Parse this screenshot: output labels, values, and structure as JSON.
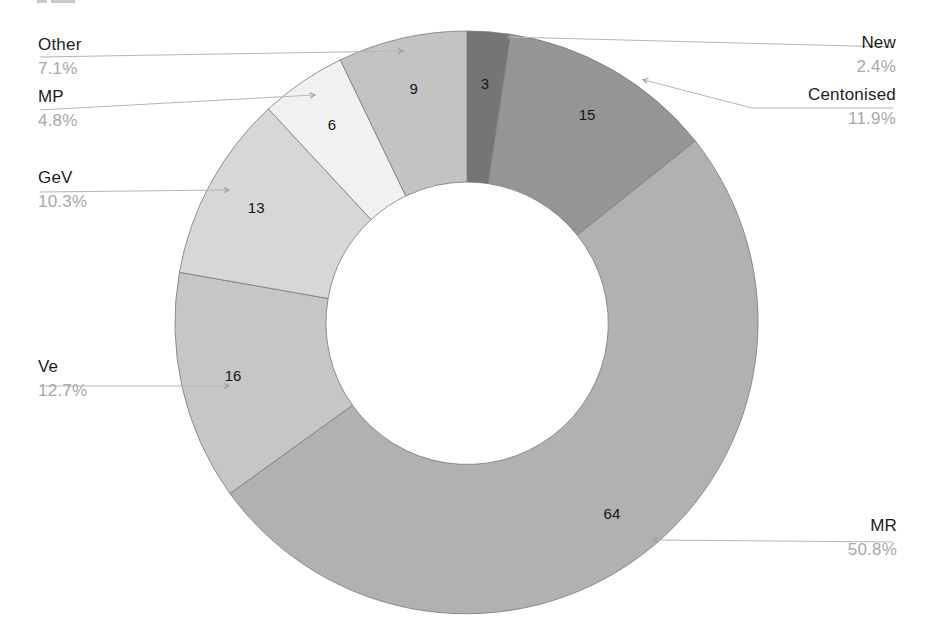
{
  "page": {
    "background": "#ffffff",
    "artifact_note": "faint cut-off text fragment along the very top-left edge (scan crop)"
  },
  "chart_data": {
    "type": "pie",
    "style": "donut",
    "title": "",
    "categories": [
      "New",
      "Centonised",
      "MR",
      "Ve",
      "GeV",
      "MP",
      "Other"
    ],
    "values": [
      3,
      15,
      64,
      16,
      13,
      6,
      9
    ],
    "percent_labels": [
      "2.4%",
      "11.9%",
      "50.8%",
      "12.7%",
      "10.3%",
      "4.8%",
      "7.1%"
    ],
    "value_labels": [
      "3",
      "15",
      "64",
      "16",
      "13",
      "6",
      "9"
    ],
    "total": 126,
    "colors": [
      "#757575",
      "#959595",
      "#b1b1b1",
      "#c6c6c6",
      "#d7d7d7",
      "#f1f1f1",
      "#c3c3c3"
    ],
    "slice_outline_color": "#7a7a7a",
    "leader_line_color": "#b5b5b5",
    "category_text_color": "#1c1c1c",
    "percent_text_color": "#a8a8a8",
    "start_angle_deg": 0,
    "direction": "clockwise",
    "starts_at": "12-o-clock",
    "inner_radius_ratio": 0.48,
    "legend_position": "none",
    "grid": false
  }
}
